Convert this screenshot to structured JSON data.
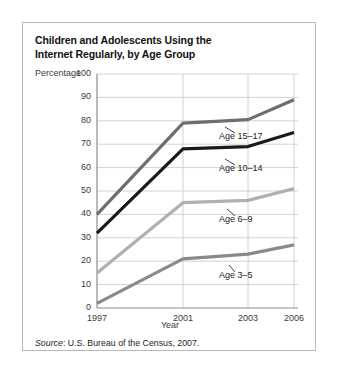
{
  "figure": {
    "title_line1": "Children and Adolescents Using the",
    "title_line2": "Internet Regularly, by Age Group",
    "source_label": "Source",
    "source_text": ": U.S. Bureau of the Census, 2007."
  },
  "chart_data": {
    "type": "line",
    "title": "Children and Adolescents Using the Internet Regularly, by Age Group",
    "xlabel": "Year",
    "ylabel": "Percentage",
    "x": [
      "1997",
      "2001",
      "2003",
      "2006"
    ],
    "xlim": [
      1997,
      2006
    ],
    "ylim": [
      0,
      100
    ],
    "ytick_step": 10,
    "yticks": [
      "0",
      "10",
      "20",
      "30",
      "40",
      "50",
      "60",
      "70",
      "80",
      "90",
      "100"
    ],
    "grid": true,
    "legend_position": "inline-labels",
    "series": [
      {
        "name": "Age 15–17",
        "color": "#6e6e6e",
        "values": [
          40,
          79,
          80.5,
          89
        ],
        "label": "Age 15–17"
      },
      {
        "name": "Age 10–14",
        "color": "#1a1a1a",
        "values": [
          32,
          68,
          69,
          75
        ],
        "label": "Age 10–14"
      },
      {
        "name": "Age 6–9",
        "color": "#b0b0b0",
        "values": [
          15,
          45,
          46,
          51
        ],
        "label": "Age 6–9"
      },
      {
        "name": "Age 3–5",
        "color": "#8a8a8a",
        "values": [
          2,
          21,
          23,
          27
        ],
        "label": "Age 3–5"
      }
    ]
  }
}
